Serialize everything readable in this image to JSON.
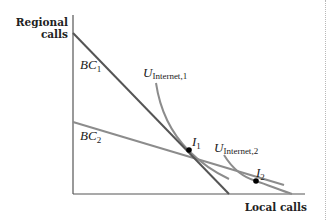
{
  "diagram": {
    "y_axis_label_line1": "Regional",
    "y_axis_label_line2": "calls",
    "x_axis_label": "Local calls",
    "budget_constraints": [
      {
        "id": "BC1",
        "label_main": "BC",
        "label_sub": "1",
        "color": "#555555"
      },
      {
        "id": "BC2",
        "label_main": "BC",
        "label_sub": "2",
        "color": "#8c8c8c"
      }
    ],
    "indifference_curves": [
      {
        "id": "U_Internet_1",
        "label_main": "U",
        "label_sub": "Internet,1",
        "color": "#8c8c8c"
      },
      {
        "id": "U_Internet_2",
        "label_main": "U",
        "label_sub": "Internet,2",
        "color": "#8c8c8c"
      }
    ],
    "points": [
      {
        "id": "I1",
        "label_main": "I",
        "label_sub": "1"
      },
      {
        "id": "I2",
        "label_main": "I",
        "label_sub": "2"
      }
    ]
  }
}
